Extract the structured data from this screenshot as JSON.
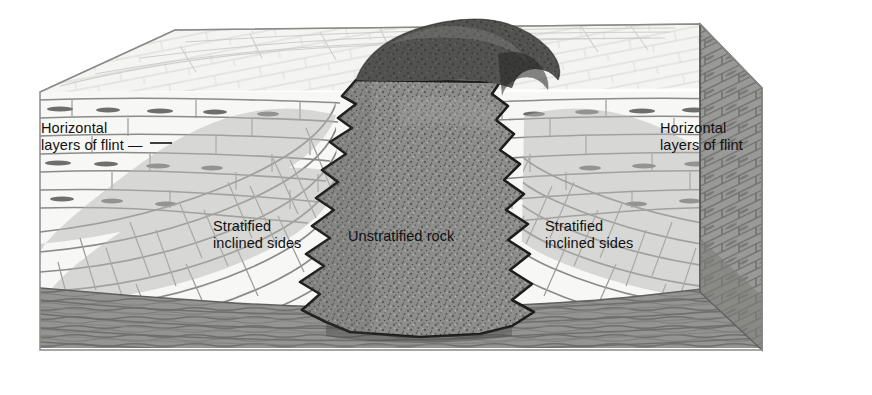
{
  "figure": {
    "type": "geological-block-diagram",
    "background_color": "#ffffff",
    "text_color": "#111111"
  },
  "labels": {
    "left_flint": {
      "line1": "Horizontal",
      "line2": "layers of flint —"
    },
    "right_flint": {
      "line1": "Horizontal",
      "line2": "layers of flint"
    },
    "left_stratified": {
      "line1": "Stratified",
      "line2": "inclined sides"
    },
    "right_stratified": {
      "line1": "Stratified",
      "line2": "inclined sides"
    },
    "center_intrusion": {
      "line1": "Unstratified rock"
    }
  },
  "regions": {
    "top_surface": {
      "name": "block-top-surface",
      "color": "#f2f2f0"
    },
    "front_face": {
      "name": "block-front-face",
      "color": "#efefed"
    },
    "right_face": {
      "name": "block-right-side-face",
      "color": "#9a9a98"
    },
    "basement": {
      "name": "basement-layer",
      "color": "#8f8f8d"
    },
    "intrusion": {
      "name": "igneous-intrusion-mass",
      "color": "#8a8a88"
    },
    "dome": {
      "name": "intrusion-dome-outcrop",
      "color": "#5f5f5f"
    }
  },
  "colors": {
    "ink": "#4a4a4a",
    "dark_ink": "#1c1c1c",
    "flint_nodule": "#6e6e6e",
    "bed_light": "#fbfbfa",
    "bed_mid": "#d8d8d6",
    "bed_shadow": "#b2b2b0"
  }
}
